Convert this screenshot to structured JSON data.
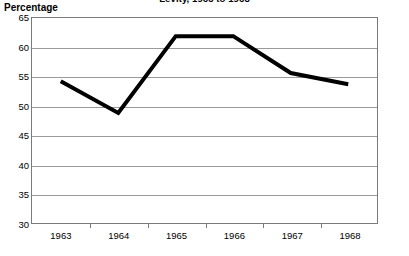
{
  "chart_data": {
    "type": "line",
    "title": "Levity, 1963 to 1968",
    "xlabel": "",
    "ylabel": "Percentage",
    "categories": [
      "1963",
      "1964",
      "1965",
      "1966",
      "1967",
      "1968"
    ],
    "values": [
      54.2,
      48.8,
      61.9,
      61.9,
      55.6,
      53.7
    ],
    "series": [
      {
        "name": "Percentage",
        "values": [
          54.2,
          48.8,
          61.9,
          61.9,
          55.6,
          53.7
        ]
      }
    ],
    "ylim": [
      30,
      65
    ],
    "ytick_step": 5,
    "yticks": [
      65,
      60,
      55,
      50,
      45,
      40,
      35,
      30
    ],
    "ytick_labels": [
      "65",
      "60",
      "55",
      "50",
      "45",
      "40",
      "35",
      "30"
    ],
    "grid": true,
    "grid_axis": "y",
    "legend": false,
    "legend_position": "none",
    "line_color": "#000000",
    "line_width": 4,
    "grid_color": "#9a9a9a",
    "frame_color": "#7a7a7a",
    "background_color": "#ffffff",
    "markers": false,
    "title_clipped": true
  }
}
